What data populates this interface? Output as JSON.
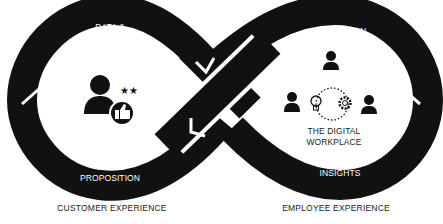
{
  "diagram": {
    "type": "infinity-loop",
    "colors": {
      "band": "#111111",
      "background": "#ffffff",
      "text_on_band": "#ffffff",
      "caption": "#222222"
    },
    "left_loop": {
      "caption": "CUSTOMER EXPERIENCE",
      "top_label_line1": "DATA &",
      "top_label_line2": "FEEDBACK",
      "bottom_label_line1": "VALUE",
      "bottom_label_line2": "PROPOSITION",
      "center_icon": "customer-rating-icon"
    },
    "right_loop": {
      "caption": "EMPLOYEE EXPERIENCE",
      "top_label": "INNOVATION",
      "bottom_label": "INSIGHTS",
      "center_title_line1": "THE DIGITAL",
      "center_title_line2": "WORKPLACE",
      "center_icons": [
        "person-icon",
        "person-icon",
        "lightbulb-icon",
        "gear-icon",
        "person-icon"
      ]
    }
  }
}
